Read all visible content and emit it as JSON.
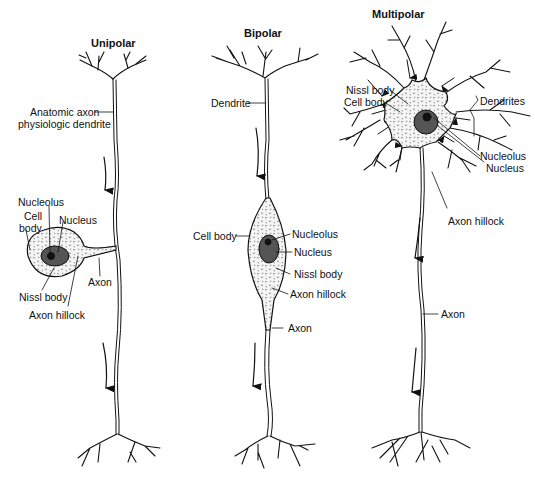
{
  "diagram": {
    "type": "neuron-types",
    "ink_color": "#111111",
    "background": "#ffffff",
    "neurons": [
      {
        "title": "Unipolar",
        "labels": {
          "process": [
            "Anatomic axon",
            "physiologic dendrite"
          ],
          "nucleolus": "Nucleolus",
          "cell_body": [
            "Cell",
            "body"
          ],
          "nucleus": "Nucleus",
          "axon": "Axon",
          "nissl_body": "Nissl body",
          "axon_hillock": "Axon hillock"
        }
      },
      {
        "title": "Bipolar",
        "labels": {
          "dendrite": "Dendrite",
          "cell_body": "Cell body",
          "nucleolus": "Nucleolus",
          "nucleus": "Nucleus",
          "nissl_body": "Nissl body",
          "axon_hillock": "Axon hillock",
          "axon": "Axon"
        }
      },
      {
        "title": "Multipolar",
        "labels": {
          "nissl_body": "Nissl body",
          "cell_body": "Cell body",
          "dendrites": "Dendrites",
          "nucleolus": "Nucleolus",
          "nucleus": "Nucleus",
          "axon_hillock": "Axon hillock",
          "axon": "Axon"
        }
      }
    ]
  }
}
